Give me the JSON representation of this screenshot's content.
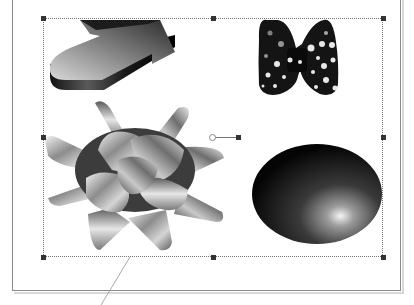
{
  "canvas": {
    "background": "#ffffff",
    "page_border_color": "#8a8a8a"
  },
  "selection": {
    "box": {
      "x": 43,
      "y": 18,
      "width": 340,
      "height": 239
    },
    "handles": [
      "top-left",
      "top-center",
      "top-right",
      "middle-left",
      "middle-right",
      "bottom-left",
      "bottom-center",
      "bottom-right"
    ],
    "rotation_handle": {
      "x": 213,
      "y": 137
    }
  },
  "clipart": [
    {
      "name": "3d-arrow",
      "style": "gray gradient extruded arrow"
    },
    {
      "name": "polka-dot-bow-tie",
      "style": "black with white dots"
    },
    {
      "name": "gift-bow",
      "style": "silver ribbon star bow"
    },
    {
      "name": "shaded-sphere",
      "style": "black radial gradient with highlight"
    }
  ],
  "callout": {
    "leader_line": {
      "x1": 130,
      "y1": 257,
      "x2": 101,
      "y2": 305
    }
  }
}
